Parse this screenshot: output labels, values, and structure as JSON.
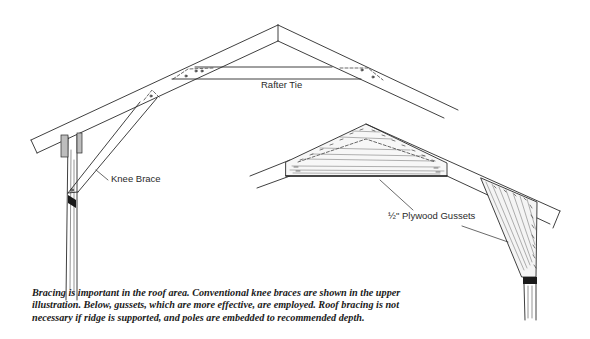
{
  "figure": {
    "labels": {
      "rafter_tie": "Rafter Tie",
      "knee_brace": "Knee Brace",
      "plywood_gussets": "½\" Plywood Gussets"
    },
    "caption": {
      "lines": [
        "Bracing is important in the roof area. Conventional knee braces are shown in the upper",
        "illustration. Below, gussets, which are more effective, are employed. Roof bracing is not",
        "necessary if ridge is supported, and poles are embedded to recommended depth."
      ]
    },
    "colors": {
      "ink": "#2a2a2a",
      "background": "#ffffff"
    }
  }
}
